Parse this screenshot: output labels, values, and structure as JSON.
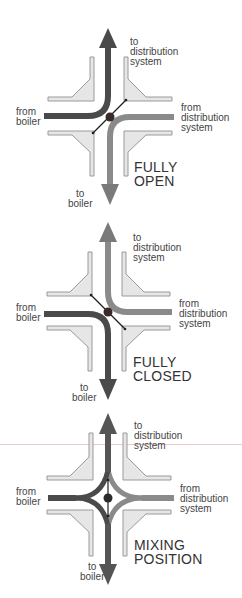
{
  "diagrams": [
    {
      "state": "fully-open",
      "state_label_line1": "FULLY",
      "state_label_line2": "OPEN",
      "labels": {
        "to_dist_1": "to",
        "to_dist_2": "distribution",
        "to_dist_3": "system",
        "from_boiler_1": "from",
        "from_boiler_2": "boiler",
        "from_dist_1": "from",
        "from_dist_2": "distribution",
        "from_dist_3": "system",
        "to_boiler_1": "to",
        "to_boiler_2": "boiler"
      }
    },
    {
      "state": "fully-closed",
      "state_label_line1": "FULLY",
      "state_label_line2": "CLOSED",
      "labels": {
        "to_dist_1": "to",
        "to_dist_2": "distribution",
        "to_dist_3": "system",
        "from_boiler_1": "from",
        "from_boiler_2": "boiler",
        "from_dist_1": "from",
        "from_dist_2": "distribution",
        "from_dist_3": "system",
        "to_boiler_1": "to",
        "to_boiler_2": "boiler"
      }
    },
    {
      "state": "mixing-position",
      "state_label_line1": "MIXING",
      "state_label_line2": "POSITION",
      "labels": {
        "to_dist_1": "to",
        "to_dist_2": "distribution",
        "to_dist_3": "system",
        "from_boiler_1": "from",
        "from_boiler_2": "boiler",
        "from_dist_1": "from",
        "from_dist_2": "distribution",
        "from_dist_3": "system",
        "to_boiler_1": "to",
        "to_boiler_2": "boiler"
      }
    }
  ],
  "colors": {
    "hot_flow": "#4a4a4a",
    "cool_flow": "#8a8a8a",
    "valve_body_fill": "#e6e6e6",
    "valve_body_stroke": "#9a9a9a",
    "disc": "#1e1e1e",
    "pivot": "#3a2a2a"
  }
}
